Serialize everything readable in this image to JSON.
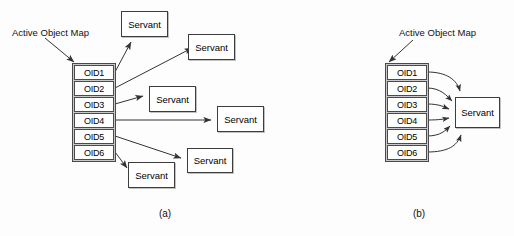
{
  "figure": {
    "width": 514,
    "height": 236,
    "background": "#fdfdfd",
    "line_color": "#333333",
    "box_fill": "#ffffff",
    "table_border_fill": "#c9c9c9"
  },
  "panel_a": {
    "caption": "(a)",
    "map_label": "Active Object Map",
    "table": {
      "name": "active-object-map-table",
      "rows": [
        "OID1",
        "OID2",
        "OID3",
        "OID4",
        "OID5",
        "OID6"
      ]
    },
    "servants": [
      {
        "label": "Servant",
        "from": "OID1",
        "x": 121,
        "y": 11,
        "w": 47,
        "h": 26
      },
      {
        "label": "Servant",
        "from": "OID2",
        "x": 188,
        "y": 34,
        "w": 47,
        "h": 26
      },
      {
        "label": "Servant",
        "from": "OID3",
        "x": 149,
        "y": 86,
        "w": 47,
        "h": 26
      },
      {
        "label": "Servant",
        "from": "OID4",
        "x": 217,
        "y": 106,
        "w": 47,
        "h": 26
      },
      {
        "label": "Servant",
        "from": "OID5",
        "x": 187,
        "y": 148,
        "w": 46,
        "h": 25
      },
      {
        "label": "Servant",
        "from": "OID6",
        "x": 128,
        "y": 162,
        "w": 47,
        "h": 26
      }
    ]
  },
  "panel_b": {
    "caption": "(b)",
    "map_label": "Active Object Map",
    "table": {
      "name": "active-object-map-table",
      "rows": [
        "OID1",
        "OID2",
        "OID3",
        "OID4",
        "OID5",
        "OID6"
      ]
    },
    "servant": {
      "label": "Servant",
      "x": 455,
      "y": 97,
      "w": 45,
      "h": 31
    }
  }
}
